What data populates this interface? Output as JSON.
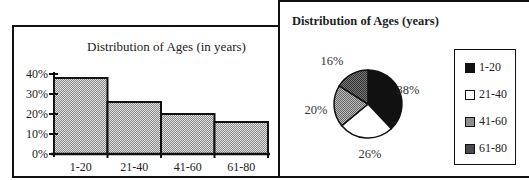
{
  "chart_data": [
    {
      "type": "bar",
      "title": "Distribution of Ages (in years)",
      "xlabel": "",
      "ylabel": "",
      "categories": [
        "1-20",
        "21-40",
        "41-60",
        "61-80"
      ],
      "values": [
        38,
        26,
        20,
        16
      ],
      "unit": "%",
      "yticks": [
        "0%",
        "10%",
        "20%",
        "30%",
        "40%"
      ],
      "ylim": [
        0,
        40
      ],
      "grid": false,
      "bar_fill": "#c8c8c8",
      "legend": null
    },
    {
      "type": "pie",
      "title": "Distribution of Ages (years)",
      "categories": [
        "1-20",
        "21-40",
        "41-60",
        "61-80"
      ],
      "values": [
        38,
        26,
        20,
        16
      ],
      "labels": [
        "38%",
        "26%",
        "20%",
        "16%"
      ],
      "colors": [
        "#111111",
        "#ffffff",
        "#9a9a9a",
        "#555555"
      ],
      "legend": {
        "position": "right",
        "entries": [
          "1-20",
          "21-40",
          "41-60",
          "61-80"
        ]
      }
    }
  ]
}
